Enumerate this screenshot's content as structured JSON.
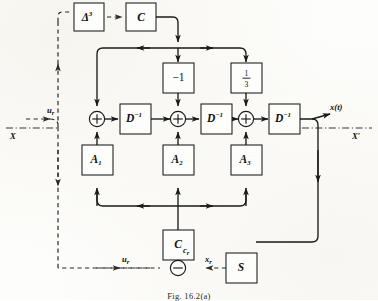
{
  "figure": {
    "caption": "Fig. 16.2(a)",
    "type": "signal-flow-block-diagram"
  },
  "blocks": {
    "delta_cubed": "Δ",
    "delta_cubed_exp": "3",
    "c_top": "C",
    "c_bottom": "C",
    "gain_minus_one": "−1",
    "gain_one_third_num": "1",
    "gain_one_third_den": "3",
    "delay_1": "D",
    "delay_1_exp": "−1",
    "delay_2": "D",
    "delay_2_exp": "−1",
    "delay_3": "D",
    "delay_3_exp": "−1",
    "a1": "A",
    "a1_sub": "1",
    "a2": "A",
    "a2_sub": "2",
    "a3": "A",
    "a3_sub": "3",
    "s_block": "S"
  },
  "nodes": {
    "sum_1": "+",
    "sum_2": "+",
    "sum_3": "+",
    "difference": "−"
  },
  "signals": {
    "input_ur_top": "u",
    "input_ur_top_sub": "r",
    "input_ur_bottom": "u",
    "input_ur_bottom_sub": "r",
    "feedback_xr": "x",
    "feedback_xr_sub": "r",
    "control_cr": "c",
    "control_cr_sub": "r",
    "output": "x(t)"
  },
  "axes": {
    "left_label": "X",
    "right_label": "X",
    "right_prime": "′"
  },
  "colors": {
    "ink": "#1a1a1a",
    "dashed_ink": "#2a2a2a",
    "paper": "#fdfdfb"
  }
}
